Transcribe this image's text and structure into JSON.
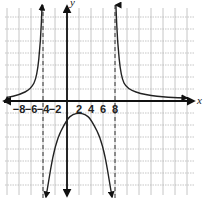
{
  "chart_data": {
    "type": "line",
    "title": "",
    "xlabel": "x",
    "ylabel": "y",
    "x_ticks": [
      -8,
      -6,
      -4,
      -2,
      2,
      4,
      6,
      8
    ],
    "x_tick_labels": [
      "-8",
      "-6",
      "-4",
      "-2",
      "2",
      "4",
      "6",
      "8"
    ],
    "xlim": [
      -10,
      22
    ],
    "ylim": [
      -18,
      17
    ],
    "grid": true,
    "asymptotes": {
      "vertical": [
        -4,
        8
      ],
      "horizontal": [
        0
      ]
    },
    "series": [
      {
        "name": "left branch",
        "description": "approaches 0 from above as x→-∞, rises to +∞ as x→-4⁻",
        "points": [
          [
            -10,
            0.6
          ],
          [
            -8,
            1.0
          ],
          [
            -6,
            2.0
          ],
          [
            -5,
            4.0
          ],
          [
            -4.4,
            10
          ],
          [
            -4.15,
            16
          ]
        ]
      },
      {
        "name": "middle branch",
        "description": "downward parabola-like between asymptotes, max near x=2, y≈-2",
        "points": [
          [
            -3.5,
            -16
          ],
          [
            -2,
            -7
          ],
          [
            0,
            -3
          ],
          [
            1,
            -2.2
          ],
          [
            2,
            -2
          ],
          [
            3,
            -2.2
          ],
          [
            4,
            -3
          ],
          [
            6,
            -7
          ],
          [
            7.5,
            -16
          ]
        ]
      },
      {
        "name": "right branch",
        "description": "descends from +∞ near x=8⁺, approaches 0 from above",
        "points": [
          [
            8.15,
            16
          ],
          [
            8.4,
            10
          ],
          [
            9,
            4
          ],
          [
            10,
            2
          ],
          [
            13,
            1
          ],
          [
            17,
            0.6
          ],
          [
            20,
            0.5
          ]
        ]
      }
    ]
  },
  "labels": {
    "x_axis": "x",
    "y_axis": "y"
  },
  "colors": {
    "curve": "#222222",
    "grid": "#b8b8b8",
    "axis": "#111111",
    "asymptote": "#333333"
  }
}
